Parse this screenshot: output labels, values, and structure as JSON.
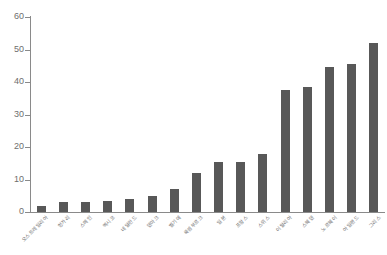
{
  "chart_data": {
    "type": "bar",
    "title": "",
    "subtitle": "",
    "xlabel": "",
    "ylabel": "",
    "ylim": [
      0,
      60
    ],
    "xlim_categories": 16,
    "grid": false,
    "legend": null,
    "bar_color": "#585858",
    "axis_color": "#8a8a8a",
    "tick_label_color": "#6e6e6e",
    "background": "#ffffff",
    "ytick_values": [
      0,
      10,
      20,
      30,
      40,
      50,
      60
    ],
    "ytick_labels": [
      "0",
      "10",
      "20",
      "30",
      "40",
      "50",
      "60"
    ],
    "categories": [
      "오스트레일리아",
      "헝가리",
      "스페인",
      "멕시코",
      "네덜란드",
      "덴마크",
      "벨기에",
      "룩셈부르크",
      "일본",
      "프랑스",
      "스위스",
      "이탈리아",
      "스웨덴",
      "노르웨이",
      "아일랜드",
      "그리스"
    ],
    "values": [
      2,
      3,
      3,
      3.5,
      4,
      5,
      7,
      12,
      15.5,
      15.5,
      18,
      37.5,
      38.5,
      44.5,
      45.5,
      52
    ]
  }
}
